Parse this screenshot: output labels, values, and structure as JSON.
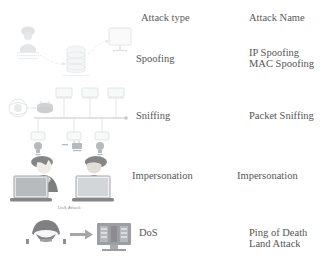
{
  "figure": {
    "columns": {
      "attack_type_header": "Attack type",
      "attack_name_header": "Attack Name"
    },
    "rows": [
      {
        "attack_type": "Spoofing",
        "attack_names": [
          "IP Spoofing",
          "MAC Spoofing"
        ],
        "diagram": {
          "name": "spoofing-diagram",
          "nodes": [
            "attacker-icon",
            "server-icon",
            "monitor-icon"
          ],
          "arrows": 2
        }
      },
      {
        "attack_type": "Sniffing",
        "attack_names": [
          "Packet Sniffing"
        ],
        "diagram": {
          "name": "sniffing-network-diagram",
          "nodes": [
            "cloud-icon",
            "router-icon",
            "bus-network",
            "workstation-icon"
          ],
          "arrows": 0
        }
      },
      {
        "attack_type": "Impersonation",
        "attack_names": [
          "Impersonation"
        ],
        "diagram": {
          "name": "impersonation-diagram",
          "nodes": [
            "person-laptop-icon",
            "person-laptop-icon",
            "bulb-icon",
            "message-icon",
            "bulb-icon"
          ],
          "arrows": 0
        }
      },
      {
        "attack_type": "DoS",
        "attack_names": [
          "Ping of Death",
          "Land Attack"
        ],
        "caption": "DoS Attack",
        "diagram": {
          "name": "dos-attack-diagram",
          "nodes": [
            "hacker-icon",
            "server-rack-icon"
          ],
          "arrows": 1
        }
      }
    ]
  },
  "colors": {
    "background": "#ffffff",
    "text": "#565656",
    "diagram_stroke": "#9aa0a6",
    "diagram_dark": "#4d4d4d"
  }
}
